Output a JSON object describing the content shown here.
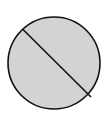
{
  "diagram": {
    "shape": "circle",
    "fill": "#d3d3d3",
    "stroke": "#111111",
    "circle": {
      "cx": 54,
      "cy": 63,
      "r": 46
    },
    "chord": {
      "x1": 22.5,
      "y1": 29,
      "x2": 91,
      "y2": 97
    }
  }
}
